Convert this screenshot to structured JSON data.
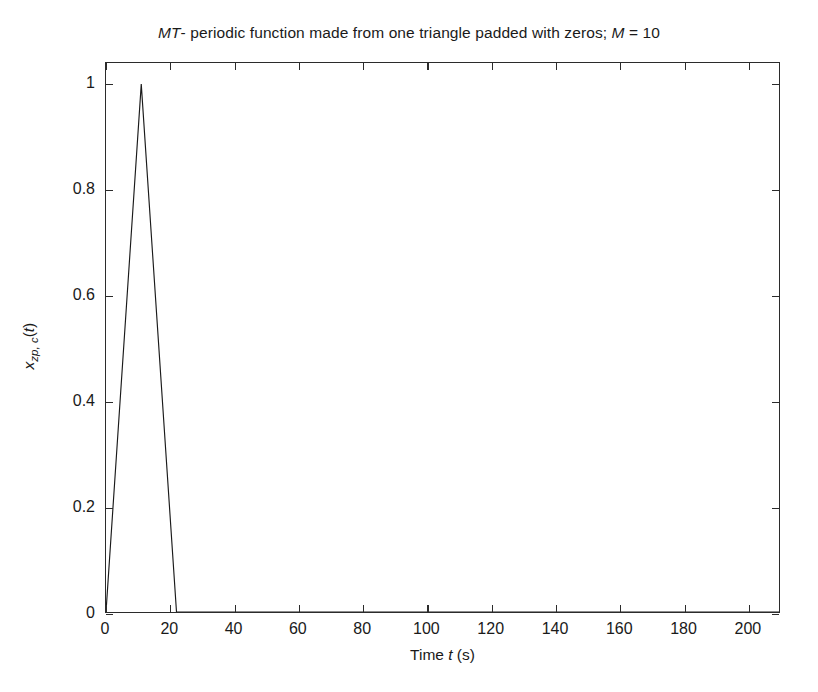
{
  "chart_data": {
    "type": "line",
    "title": "MT- periodic function made from one triangle padded with zeros; M = 10",
    "title_italic_prefix": "MT",
    "title_rest": "- periodic function made from one triangle padded with zeros; ",
    "title_italic_m": "M",
    "title_m_value": " = 10",
    "xlabel": "Time t (s)",
    "xlabel_prefix": "Time ",
    "xlabel_italic": "t",
    "xlabel_suffix": " (s)",
    "ylabel": "x_zp,c(t)",
    "ylabel_base": "x",
    "ylabel_sub": "zp, c",
    "ylabel_arg": "(t)",
    "xlim": [
      0,
      210
    ],
    "ylim": [
      0,
      1.04
    ],
    "xticks": [
      0,
      20,
      40,
      60,
      80,
      100,
      120,
      140,
      160,
      180,
      200
    ],
    "xticklabels": [
      "0",
      "20",
      "40",
      "60",
      "80",
      "100",
      "120",
      "140",
      "160",
      "180",
      "200"
    ],
    "yticks": [
      0,
      0.2,
      0.4,
      0.6,
      0.8,
      1
    ],
    "yticklabels": [
      "0",
      "0.2",
      "0.4",
      "0.6",
      "0.8",
      "1"
    ],
    "grid": false,
    "legend": false,
    "box": true,
    "tick_direction": "in",
    "line_color": "#1a1a1a",
    "line_width": 1.1,
    "background_color": "#ffffff",
    "axis_color": "#2b2b2b",
    "series": [
      {
        "name": "x_zp,c(t)",
        "x": [
          0,
          11,
          22,
          210
        ],
        "y": [
          0,
          1,
          0,
          0
        ]
      }
    ],
    "annotations": []
  }
}
